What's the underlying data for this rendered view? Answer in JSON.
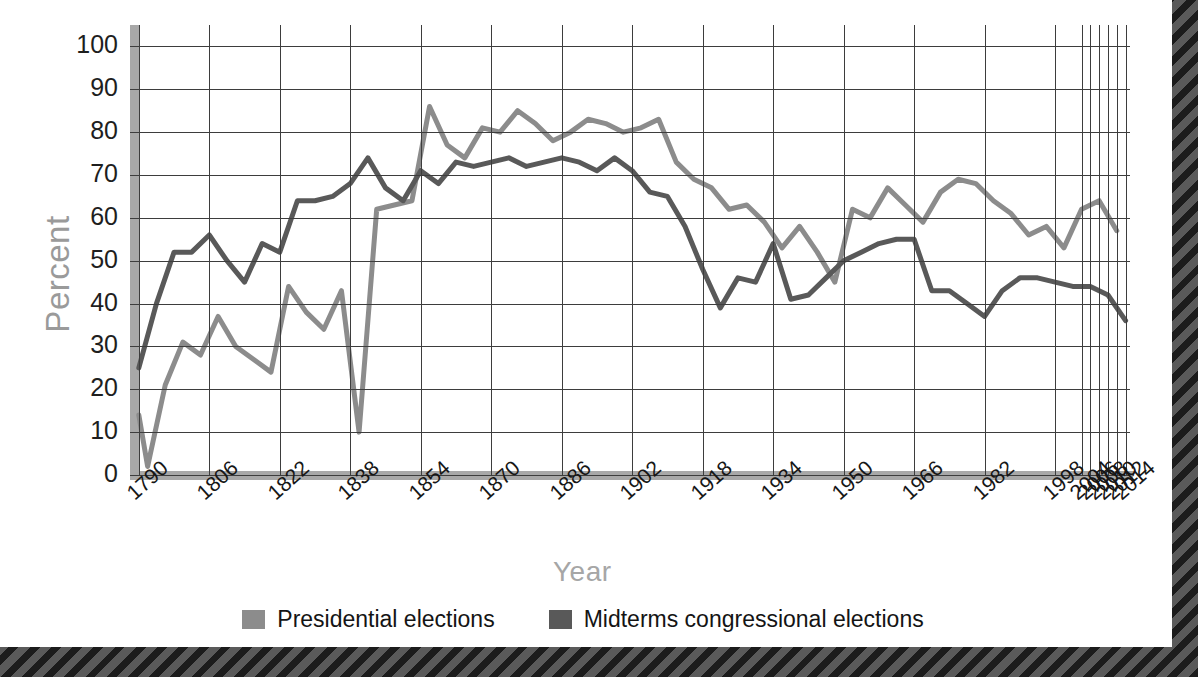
{
  "chart_data": {
    "type": "line",
    "title": "",
    "xlabel": "Year",
    "ylabel": "Percent",
    "ylim": [
      0,
      105
    ],
    "xlim": [
      1788,
      2015
    ],
    "yticks": [
      0,
      10,
      20,
      30,
      40,
      50,
      60,
      70,
      80,
      90,
      100
    ],
    "xticks": [
      1790,
      1806,
      1822,
      1838,
      1854,
      1870,
      1886,
      1902,
      1918,
      1934,
      1950,
      1966,
      1982,
      1998,
      2004,
      2006,
      2008,
      2010,
      2012,
      2014
    ],
    "grid": true,
    "legend_position": "bottom-center",
    "series": [
      {
        "name": "Presidential elections",
        "color": "#8c8c8c",
        "x": [
          1790,
          1792,
          1796,
          1800,
          1804,
          1808,
          1812,
          1816,
          1820,
          1824,
          1828,
          1832,
          1836,
          1840,
          1844,
          1848,
          1852,
          1856,
          1860,
          1864,
          1868,
          1872,
          1876,
          1880,
          1884,
          1888,
          1892,
          1896,
          1900,
          1904,
          1908,
          1912,
          1916,
          1920,
          1924,
          1928,
          1932,
          1936,
          1940,
          1944,
          1948,
          1952,
          1956,
          1960,
          1964,
          1968,
          1972,
          1976,
          1980,
          1984,
          1988,
          1992,
          1996,
          2000,
          2004,
          2008,
          2012
        ],
        "values": [
          14,
          2,
          21,
          31,
          28,
          37,
          30,
          27,
          24,
          44,
          38,
          34,
          43,
          10,
          62,
          63,
          64,
          86,
          77,
          74,
          81,
          80,
          85,
          82,
          78,
          80,
          83,
          82,
          80,
          81,
          83,
          73,
          69,
          67,
          62,
          63,
          59,
          53,
          58,
          52,
          45,
          62,
          60,
          67,
          63,
          59,
          66,
          69,
          68,
          64,
          61,
          56,
          58,
          53,
          62,
          64,
          57
        ]
      },
      {
        "name": "Midterms congressional elections",
        "color": "#595959",
        "x": [
          1790,
          1794,
          1798,
          1802,
          1806,
          1810,
          1814,
          1818,
          1822,
          1826,
          1830,
          1834,
          1838,
          1842,
          1846,
          1850,
          1854,
          1858,
          1862,
          1866,
          1870,
          1874,
          1878,
          1882,
          1886,
          1890,
          1894,
          1898,
          1902,
          1906,
          1910,
          1914,
          1918,
          1922,
          1926,
          1930,
          1934,
          1938,
          1942,
          1946,
          1950,
          1954,
          1958,
          1962,
          1966,
          1970,
          1974,
          1978,
          1982,
          1986,
          1990,
          1994,
          1998,
          2002,
          2006,
          2010,
          2014
        ],
        "values": [
          25,
          40,
          52,
          52,
          56,
          50,
          45,
          54,
          52,
          64,
          64,
          65,
          68,
          74,
          67,
          64,
          71,
          68,
          73,
          72,
          73,
          74,
          72,
          73,
          74,
          73,
          71,
          74,
          71,
          66,
          65,
          58,
          48,
          39,
          46,
          45,
          54,
          41,
          42,
          46,
          50,
          52,
          54,
          55,
          55,
          43,
          43,
          40,
          37,
          43,
          46,
          46,
          45,
          44,
          44,
          42,
          36
        ]
      }
    ]
  },
  "legend": {
    "items": [
      {
        "label": "Presidential elections",
        "color": "#8c8c8c"
      },
      {
        "label": "Midterms congressional elections",
        "color": "#595959"
      }
    ]
  },
  "axis": {
    "y_title": "Percent",
    "x_title": "Year"
  },
  "clipped_title": ""
}
